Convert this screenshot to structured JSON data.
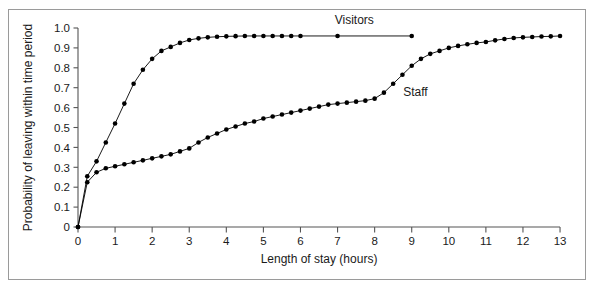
{
  "chart_data": {
    "type": "line",
    "title": "",
    "xlabel": "Length of stay (hours)",
    "ylabel": "Probability of leaving within time period",
    "xlim": [
      0,
      13
    ],
    "ylim": [
      0,
      1.0
    ],
    "xticks": [
      0,
      1,
      2,
      3,
      4,
      5,
      6,
      7,
      8,
      9,
      10,
      11,
      12,
      13
    ],
    "xtick_labels": [
      "0",
      "1",
      "2",
      "3",
      "4",
      "5",
      "6",
      "7",
      "8",
      "9",
      "10",
      "11",
      "12",
      "13"
    ],
    "yticks": [
      0,
      0.1,
      0.2,
      0.3,
      0.4,
      0.5,
      0.6,
      0.7,
      0.8,
      0.9,
      1.0
    ],
    "ytick_labels": [
      "0",
      "0.1",
      "0.2",
      "0.3",
      "0.4",
      "0.5",
      "0.6",
      "0.7",
      "0.8",
      "0.9",
      "1.0"
    ],
    "grid": false,
    "legend": "inline-annotations",
    "marker": "filled-circle",
    "line_color": "#000000",
    "marker_color": "#000000",
    "annotations": [
      {
        "text": "Visitors",
        "x": 7.45,
        "y": 1.02
      },
      {
        "text": "Staff",
        "x": 9.1,
        "y": 0.66
      }
    ],
    "series": [
      {
        "name": "Visitors",
        "x": [
          0,
          0.25,
          0.5,
          0.75,
          1.0,
          1.25,
          1.5,
          1.75,
          2.0,
          2.25,
          2.5,
          2.75,
          3.0,
          3.25,
          3.5,
          3.75,
          4.0,
          4.25,
          4.5,
          4.75,
          5.0,
          5.25,
          5.5,
          5.75,
          6.0,
          7.0,
          9.0
        ],
        "y": [
          0,
          0.255,
          0.33,
          0.425,
          0.52,
          0.62,
          0.72,
          0.79,
          0.845,
          0.885,
          0.905,
          0.925,
          0.94,
          0.948,
          0.953,
          0.956,
          0.958,
          0.959,
          0.96,
          0.96,
          0.96,
          0.96,
          0.96,
          0.96,
          0.96,
          0.96,
          0.96
        ]
      },
      {
        "name": "Staff",
        "x": [
          0,
          0.25,
          0.5,
          0.75,
          1.0,
          1.25,
          1.5,
          1.75,
          2.0,
          2.25,
          2.5,
          2.75,
          3.0,
          3.25,
          3.5,
          3.75,
          4.0,
          4.25,
          4.5,
          4.75,
          5.0,
          5.25,
          5.5,
          5.75,
          6.0,
          6.25,
          6.5,
          6.75,
          7.0,
          7.25,
          7.5,
          7.75,
          8.0,
          8.25,
          8.5,
          8.75,
          9.0,
          9.25,
          9.5,
          9.75,
          10.0,
          10.25,
          10.5,
          10.75,
          11.0,
          11.25,
          11.5,
          11.75,
          12.0,
          12.25,
          12.5,
          12.75,
          13.0
        ],
        "y": [
          0,
          0.225,
          0.275,
          0.295,
          0.305,
          0.315,
          0.325,
          0.335,
          0.345,
          0.355,
          0.365,
          0.38,
          0.395,
          0.425,
          0.45,
          0.47,
          0.49,
          0.505,
          0.52,
          0.53,
          0.545,
          0.555,
          0.565,
          0.575,
          0.585,
          0.595,
          0.605,
          0.615,
          0.62,
          0.625,
          0.63,
          0.635,
          0.645,
          0.675,
          0.72,
          0.765,
          0.81,
          0.845,
          0.87,
          0.885,
          0.9,
          0.91,
          0.918,
          0.925,
          0.93,
          0.938,
          0.945,
          0.95,
          0.953,
          0.955,
          0.957,
          0.958,
          0.96
        ]
      }
    ]
  },
  "axes": {
    "x_origin_px": 78,
    "y_origin_px": 227,
    "px_per_x_unit": 37.08,
    "px_per_y_unit": 199.0
  }
}
